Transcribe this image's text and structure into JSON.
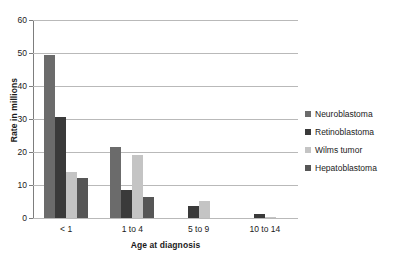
{
  "chart_data": {
    "type": "bar",
    "title": "",
    "xlabel": "Age at diagnosis",
    "ylabel": "Rate in millions",
    "categories": [
      "< 1",
      "1 to 4",
      "5 to 9",
      "10 to 14"
    ],
    "ylim": [
      0,
      60
    ],
    "yticks": [
      0,
      10,
      20,
      30,
      40,
      50,
      60
    ],
    "ytick_labels": [
      "0",
      "10",
      "20",
      "30",
      "40",
      "50",
      "60"
    ],
    "grid": true,
    "legend_position": "right",
    "series": [
      {
        "name": "Neuroblastoma",
        "color": "#6b6b6b",
        "values": [
          49.5,
          21.5,
          0,
          0
        ]
      },
      {
        "name": "Retinoblastoma",
        "color": "#3a3a3a",
        "values": [
          30.7,
          8.6,
          3.6,
          1.2
        ]
      },
      {
        "name": "Wilms tumor",
        "color": "#c4c4c4",
        "values": [
          13.8,
          19.0,
          5.2,
          0.4
        ]
      },
      {
        "name": "Hepatoblastoma",
        "color": "#565656",
        "values": [
          12.0,
          6.3,
          0,
          0
        ]
      }
    ]
  }
}
